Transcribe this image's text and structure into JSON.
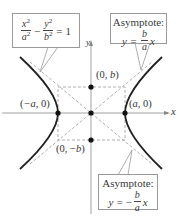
{
  "diagram": {
    "type": "hyperbola",
    "equation": {
      "lhs_term1_num": "x",
      "lhs_term1_num_exp": "2",
      "lhs_term1_den": "a",
      "lhs_term1_den_exp": "2",
      "operator": "−",
      "lhs_term2_num": "y",
      "lhs_term2_num_exp": "2",
      "lhs_term2_den": "b",
      "lhs_term2_den_exp": "2",
      "equals": "=",
      "rhs": "1"
    },
    "asymptote_positive": {
      "title": "Asymptote:",
      "lhs": "y =",
      "sign": "",
      "frac_num": "b",
      "frac_den": "a",
      "var": "x"
    },
    "asymptote_negative": {
      "title": "Asymptote:",
      "lhs": "y =",
      "sign": "−",
      "frac_num": "b",
      "frac_den": "a",
      "var": "x"
    },
    "axes": {
      "x_label": "x",
      "y_label": "y"
    },
    "points": [
      {
        "label": "(−a, 0)",
        "role": "left-vertex"
      },
      {
        "label": "(a, 0)",
        "role": "right-vertex"
      },
      {
        "label": "(0, b)",
        "role": "co-vertex-top"
      },
      {
        "label": "(0, −b)",
        "role": "co-vertex-bottom"
      },
      {
        "label": "",
        "role": "center"
      }
    ],
    "colors": {
      "curve": "#222222",
      "axes": "#888888",
      "dashed": "#9a9a9a",
      "points": "#111111",
      "box_border": "#9a9a9a"
    }
  }
}
